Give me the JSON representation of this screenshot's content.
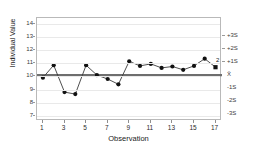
{
  "chart_data": {
    "type": "line",
    "chart_kind": "individuals-control-chart",
    "title": "",
    "xlabel": "Observation",
    "ylabel": "Individual Value",
    "x": [
      1,
      2,
      3,
      4,
      5,
      6,
      7,
      8,
      9,
      10,
      11,
      12,
      13,
      14,
      15,
      16,
      17
    ],
    "values": [
      9.9,
      10.85,
      8.8,
      8.65,
      10.85,
      10.1,
      9.8,
      9.4,
      11.15,
      10.8,
      10.95,
      10.65,
      10.75,
      10.5,
      10.8,
      11.35,
      10.7
    ],
    "series": [
      {
        "name": "Individual Value",
        "values": [
          9.9,
          10.85,
          8.8,
          8.65,
          10.85,
          10.1,
          9.8,
          9.4,
          11.15,
          10.8,
          10.95,
          10.65,
          10.75,
          10.5,
          10.8,
          11.35,
          10.7
        ]
      }
    ],
    "ylim": [
      6.6,
      14.45
    ],
    "xlim": [
      0.45,
      17.6
    ],
    "y_ticks": [
      7,
      8,
      9,
      10,
      11,
      12,
      13,
      14
    ],
    "y_tick_labels": [
      "7",
      "8",
      "9",
      "10",
      "11",
      "12",
      "13",
      "14"
    ],
    "x_ticks": [
      1,
      3,
      5,
      7,
      9,
      11,
      13,
      15,
      17
    ],
    "x_tick_labels": [
      "1",
      "3",
      "5",
      "7",
      "9",
      "11",
      "13",
      "15",
      "17"
    ],
    "grid": true,
    "grid_axis": "y",
    "legend": false,
    "center_line": {
      "label": "X̄",
      "value": 10.1
    },
    "sigma_axis": {
      "labels": [
        "+3S",
        "+2S",
        "+1S",
        "X̄",
        "-1S",
        "-2S",
        "-3S"
      ],
      "values": [
        13.1,
        12.1,
        11.1,
        10.1,
        9.1,
        8.1,
        7.1
      ]
    },
    "annotations": [
      {
        "text": "2",
        "x": 17,
        "y": 10.7,
        "meaning": "test-2-violation"
      }
    ],
    "colors": {
      "marker": "#111111",
      "line": "#3b3b3b",
      "center_line": "#6e6e6e",
      "grid": "#e9e9e9",
      "frame": "#b9b9b9",
      "background": "#ffffff",
      "text": "#1a1a1a"
    }
  }
}
